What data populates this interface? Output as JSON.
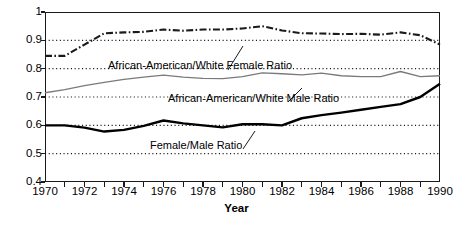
{
  "chart_data": {
    "type": "line",
    "title": "",
    "xlabel": "Year",
    "ylabel": "",
    "xlim": [
      1970,
      1990
    ],
    "ylim": [
      0.4,
      1.0
    ],
    "grid": "horizontal-dotted",
    "legend_position": "inline-annotations",
    "x": [
      1970,
      1971,
      1972,
      1973,
      1974,
      1975,
      1976,
      1977,
      1978,
      1979,
      1980,
      1981,
      1982,
      1983,
      1984,
      1985,
      1986,
      1987,
      1988,
      1989,
      1990
    ],
    "series": [
      {
        "name": "African-American/White Female Ratio",
        "style": "dash-dot",
        "color": "#1a1a1a",
        "values": [
          0.845,
          0.845,
          0.885,
          0.925,
          0.928,
          0.93,
          0.938,
          0.934,
          0.938,
          0.938,
          0.942,
          0.95,
          0.935,
          0.925,
          0.924,
          0.922,
          0.923,
          0.92,
          0.928,
          0.918,
          0.885
        ]
      },
      {
        "name": "African-American/White Male Ratio",
        "style": "solid-thin",
        "color": "#7a7a7a",
        "values": [
          0.715,
          0.726,
          0.74,
          0.752,
          0.762,
          0.77,
          0.777,
          0.77,
          0.766,
          0.765,
          0.772,
          0.785,
          0.782,
          0.778,
          0.784,
          0.775,
          0.772,
          0.772,
          0.79,
          0.772,
          0.775
        ]
      },
      {
        "name": "Female/Male Ratio",
        "style": "solid-thick",
        "color": "#000000",
        "values": [
          0.6,
          0.6,
          0.592,
          0.578,
          0.584,
          0.598,
          0.617,
          0.607,
          0.6,
          0.593,
          0.604,
          0.604,
          0.6,
          0.625,
          0.636,
          0.645,
          0.655,
          0.665,
          0.675,
          0.7,
          0.747
        ]
      }
    ],
    "y_ticks": [
      {
        "value": 1.0,
        "label": "1"
      },
      {
        "value": 0.9,
        "label": "0.9"
      },
      {
        "value": 0.8,
        "label": "0.8"
      },
      {
        "value": 0.7,
        "label": "0.7"
      },
      {
        "value": 0.6,
        "label": "0.6"
      },
      {
        "value": 0.5,
        "label": "0.5"
      },
      {
        "value": 0.4,
        "label": "0.4"
      }
    ],
    "x_ticks": [
      {
        "value": 1970,
        "label": "1970"
      },
      {
        "value": 1971,
        "label": ""
      },
      {
        "value": 1972,
        "label": "1972"
      },
      {
        "value": 1973,
        "label": ""
      },
      {
        "value": 1974,
        "label": "1974"
      },
      {
        "value": 1975,
        "label": ""
      },
      {
        "value": 1976,
        "label": "1976"
      },
      {
        "value": 1977,
        "label": ""
      },
      {
        "value": 1978,
        "label": "1978"
      },
      {
        "value": 1979,
        "label": ""
      },
      {
        "value": 1980,
        "label": "1980"
      },
      {
        "value": 1981,
        "label": ""
      },
      {
        "value": 1982,
        "label": "1982"
      },
      {
        "value": 1983,
        "label": ""
      },
      {
        "value": 1984,
        "label": "1984"
      },
      {
        "value": 1985,
        "label": ""
      },
      {
        "value": 1986,
        "label": "1986"
      },
      {
        "value": 1987,
        "label": ""
      },
      {
        "value": 1988,
        "label": "1988"
      },
      {
        "value": 1989,
        "label": ""
      },
      {
        "value": 1990,
        "label": "1990"
      }
    ],
    "annotations": [
      {
        "id": "aa-white-female",
        "text": "African-American/White Female Ratio",
        "leader": {
          "from": [
            228,
            70
          ],
          "to": [
            243,
            46
          ]
        }
      },
      {
        "id": "aa-white-male",
        "text": "African-American/White Male Ratio",
        "leader": {
          "from": [
            288,
            102
          ],
          "to": [
            302,
            88
          ]
        }
      },
      {
        "id": "female-male",
        "text": "Female/Male Ratio",
        "leader": {
          "from": [
            243,
            149
          ],
          "to": [
            255,
            131
          ]
        }
      }
    ]
  },
  "axis": {
    "x_title": "Year"
  },
  "colors": {
    "frame": "#1a1a1a",
    "grid": "#1a1a1a",
    "female_male": "#000000",
    "aa_white_male": "#7a7a7a",
    "aa_white_female": "#1a1a1a",
    "background": "#ffffff"
  }
}
